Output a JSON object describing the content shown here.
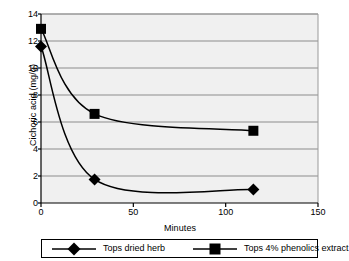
{
  "chart_data": {
    "type": "line",
    "title": "",
    "xlabel": "Minutes",
    "ylabel": "Cichoric acid (mg/g)",
    "xlim": [
      0,
      150
    ],
    "ylim": [
      0,
      14
    ],
    "xticks": [
      0,
      50,
      100,
      150
    ],
    "yticks": [
      0,
      2,
      4,
      6,
      8,
      10,
      12,
      14
    ],
    "xtick_labels": [
      "0",
      "50",
      "100",
      "150"
    ],
    "ytick_labels": [
      "0",
      "2",
      "4",
      "6",
      "8",
      "10",
      "12",
      "14"
    ],
    "grid": "horizontal",
    "legend_position": "below",
    "plot_background": "#f0f0f0",
    "line_color": "#000000",
    "series": [
      {
        "name": "Tops dried herb",
        "marker": "diamond",
        "x": [
          0,
          29,
          115
        ],
        "values": [
          11.6,
          1.75,
          1.0
        ]
      },
      {
        "name": "Tops 4% phenolics extract",
        "marker": "square",
        "x": [
          0,
          29,
          115
        ],
        "values": [
          12.9,
          6.6,
          5.35
        ]
      }
    ]
  },
  "legend": {
    "entries": [
      {
        "label": "Tops dried herb",
        "marker": "diamond-marker"
      },
      {
        "label": "Tops 4% phenolics extract",
        "marker": "square-marker"
      }
    ]
  },
  "axes": {
    "y_title": "Cichoric acid (mg/g)",
    "x_title": "Minutes"
  }
}
